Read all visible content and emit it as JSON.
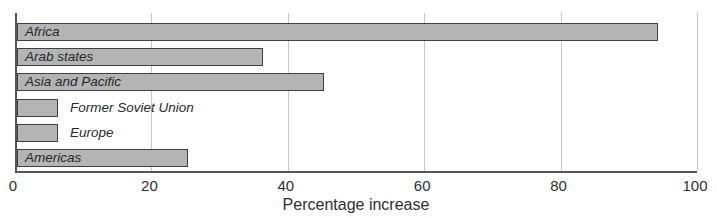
{
  "chart_data": {
    "type": "bar",
    "orientation": "horizontal",
    "title": "",
    "xlabel": "Percentage increase",
    "ylabel": "",
    "xlim": [
      0,
      100
    ],
    "xticks": [
      0,
      20,
      40,
      60,
      80,
      100
    ],
    "grid": true,
    "legend": "none",
    "categories": [
      "Africa",
      "Arab states",
      "Asia and Pacific",
      "Former Soviet Union",
      "Europe",
      "Americas"
    ],
    "values": [
      94,
      36,
      45,
      6,
      6,
      25
    ],
    "label_inside": [
      true,
      true,
      true,
      false,
      false,
      true
    ],
    "colors": {
      "bar_fill": "#b4b4b4",
      "bar_border": "#3f4042",
      "gridline": "#c6c6c6",
      "axis": "#55565a",
      "text": "#2e2e30",
      "background": "#ffffff"
    }
  }
}
